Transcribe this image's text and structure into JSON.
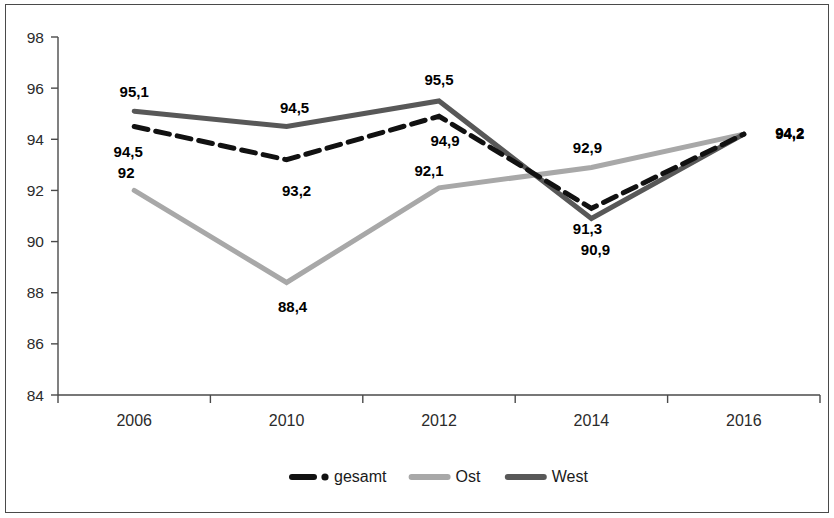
{
  "chart_data": {
    "type": "line",
    "title": "",
    "subtitle": "",
    "xlabel": "",
    "ylabel": "",
    "categories": [
      "2006",
      "2010",
      "2012",
      "2014",
      "2016"
    ],
    "ylim": [
      84,
      98
    ],
    "yticks": [
      84,
      86,
      88,
      90,
      92,
      94,
      96,
      98
    ],
    "ytick_labels": [
      "84",
      "86",
      "88",
      "90",
      "92",
      "94",
      "96",
      "98"
    ],
    "grid": false,
    "legend_position": "bottom",
    "decimal_separator": ",",
    "series": [
      {
        "name": "gesamt",
        "values": [
          94.5,
          93.2,
          94.9,
          91.3,
          94.2
        ],
        "labels": [
          "94,5",
          "93,2",
          "94,9",
          "91,3",
          "94,2"
        ],
        "color": "#111111",
        "style": "dash-dot",
        "width": 5
      },
      {
        "name": "Ost",
        "values": [
          92.0,
          88.4,
          92.1,
          92.9,
          94.2
        ],
        "labels": [
          "92",
          "88,4",
          "92,1",
          "92,9",
          "94,2"
        ],
        "color": "#a8a8a8",
        "style": "solid",
        "width": 5
      },
      {
        "name": "West",
        "values": [
          95.1,
          94.5,
          95.5,
          90.9,
          94.2
        ],
        "labels": [
          "95,1",
          "94,5",
          "95,5",
          "90,9",
          "94,2"
        ],
        "color": "#585858",
        "style": "solid",
        "width": 5
      }
    ],
    "legend": [
      {
        "label": "gesamt",
        "color": "#111111",
        "style": "dash-dot"
      },
      {
        "label": "Ost",
        "color": "#a8a8a8",
        "style": "solid"
      },
      {
        "label": "West",
        "color": "#585858",
        "style": "solid"
      }
    ]
  }
}
